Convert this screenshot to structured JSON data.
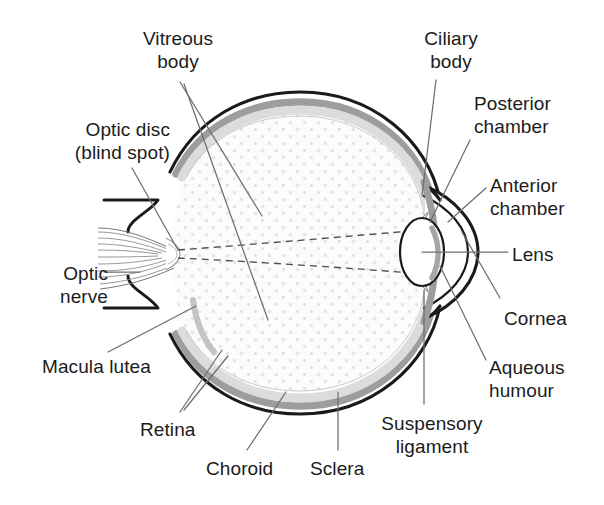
{
  "diagram": {
    "type": "anatomical-cross-section",
    "colors": {
      "outline": "#1a1a1a",
      "choroid_gray": "#9a9a9a",
      "retina_gray": "#d8d8d8",
      "vitreous_dot": "#e2e2e6",
      "vitreous_fill": "#fcfcfd",
      "leader_line": "#6b6b6b",
      "text": "#1b1b1b",
      "background": "#ffffff"
    },
    "labels": [
      {
        "id": "vitreous-body",
        "text": "Vitreous\nbody",
        "align": "center",
        "x": 132,
        "y": 27,
        "w": 92
      },
      {
        "id": "optic-disc",
        "text": "Optic disc\n(blind spot)",
        "align": "right",
        "x": 18,
        "y": 118,
        "w": 152
      },
      {
        "id": "optic-nerve",
        "text": "Optic\nnerve",
        "align": "right",
        "x": 12,
        "y": 262,
        "w": 96
      },
      {
        "id": "macula-lutea",
        "text": "Macula lutea",
        "align": "left",
        "x": 42,
        "y": 355,
        "w": 150
      },
      {
        "id": "retina",
        "text": "Retina",
        "align": "left",
        "x": 140,
        "y": 418,
        "w": 80
      },
      {
        "id": "choroid",
        "text": "Choroid",
        "align": "left",
        "x": 206,
        "y": 457,
        "w": 92
      },
      {
        "id": "sclera",
        "text": "Sclera",
        "align": "left",
        "x": 310,
        "y": 457,
        "w": 80
      },
      {
        "id": "suspensory-ligament",
        "text": "Suspensory\nligament",
        "align": "center",
        "x": 372,
        "y": 412,
        "w": 122
      },
      {
        "id": "ciliary-body",
        "text": "Ciliary\nbody",
        "align": "center",
        "x": 408,
        "y": 27,
        "w": 86
      },
      {
        "id": "posterior-chamber",
        "text": "Posterior\nchamber",
        "align": "left",
        "x": 474,
        "y": 92,
        "w": 120
      },
      {
        "id": "anterior-chamber",
        "text": "Anterior\nchamber",
        "align": "left",
        "x": 490,
        "y": 174,
        "w": 114
      },
      {
        "id": "lens",
        "text": "Lens",
        "align": "left",
        "x": 512,
        "y": 243,
        "w": 62
      },
      {
        "id": "cornea",
        "text": "Cornea",
        "align": "left",
        "x": 504,
        "y": 307,
        "w": 82
      },
      {
        "id": "aqueous-humour",
        "text": "Aqueous\nhumour",
        "align": "left",
        "x": 489,
        "y": 356,
        "w": 104
      }
    ],
    "structures": [
      "sclera",
      "choroid",
      "retina",
      "vitreous-body",
      "lens",
      "cornea",
      "iris",
      "ciliary-body",
      "suspensory-ligament",
      "optic-nerve",
      "optic-disc",
      "macula-lutea",
      "anterior-chamber",
      "posterior-chamber",
      "aqueous-humour"
    ]
  }
}
